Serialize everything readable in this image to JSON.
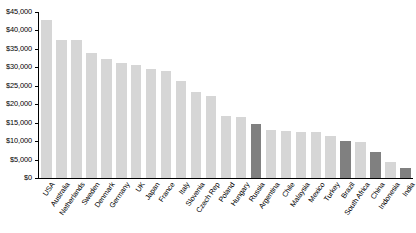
{
  "chart_data": {
    "type": "bar",
    "title": "",
    "xlabel": "",
    "ylabel": "",
    "ylim": [
      0,
      45000
    ],
    "grid": false,
    "legend": "none",
    "y_tick_labels": [
      "$45,000",
      "$40,000",
      "$35,000",
      "$30,000",
      "$25,000",
      "$20,000",
      "$15,000",
      "$10,000",
      "$5,000",
      "$0"
    ],
    "y_tick_values": [
      45000,
      40000,
      35000,
      30000,
      25000,
      20000,
      15000,
      10000,
      5000,
      0
    ],
    "categories": [
      "USA",
      "Australia",
      "Netherlands",
      "Sweden",
      "Denmark",
      "Germany",
      "UK",
      "Japan",
      "France",
      "Italy",
      "Slovenia",
      "Czech Rep",
      "Poland",
      "Hungary",
      "Russia",
      "Argentina",
      "Chile",
      "Malaysia",
      "Mexico",
      "Turkey",
      "Brazil",
      "South Africa",
      "China",
      "Indonesia",
      "India"
    ],
    "values": [
      42800,
      37400,
      37300,
      33800,
      32300,
      31200,
      30700,
      29600,
      28900,
      26200,
      23400,
      22200,
      16700,
      16600,
      14600,
      13000,
      12800,
      12600,
      12400,
      11500,
      9900,
      9700,
      7100,
      4400,
      2700
    ],
    "colors": [
      "#D6D6D6",
      "#D6D6D6",
      "#D6D6D6",
      "#D6D6D6",
      "#D6D6D6",
      "#D6D6D6",
      "#D6D6D6",
      "#D6D6D6",
      "#D6D6D6",
      "#D6D6D6",
      "#D6D6D6",
      "#D6D6D6",
      "#D6D6D6",
      "#D6D6D6",
      "#808080",
      "#D6D6D6",
      "#D6D6D6",
      "#D6D6D6",
      "#D6D6D6",
      "#D6D6D6",
      "#808080",
      "#D6D6D6",
      "#808080",
      "#D6D6D6",
      "#808080"
    ],
    "series_color_light": "#D6D6D6",
    "series_color_dark": "#808080"
  }
}
